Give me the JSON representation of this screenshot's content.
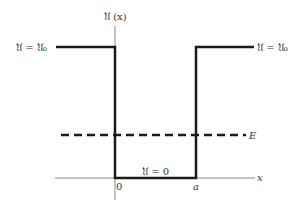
{
  "diagram": {
    "y_axis_label": "𝔘 (x)",
    "x_axis_label": "x",
    "left_level_label": "𝔘 = 𝔘₀",
    "right_level_label": "𝔘 = 𝔘₀",
    "bottom_level_label": "𝔘 = 0",
    "origin_label": "0",
    "well_width_label": "a",
    "energy_label": "E",
    "colors": {
      "potential": "#1a1a1a",
      "axis": "#888888",
      "energy": "#1a1a1a"
    }
  }
}
